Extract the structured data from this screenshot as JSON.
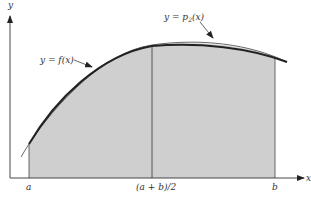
{
  "diagram": {
    "type": "simpsons-rule-illustration",
    "axes": {
      "x_label": "x",
      "y_label": "y"
    },
    "tick_labels": {
      "a": "a",
      "midpoint": "(a + b)/2",
      "b": "b"
    },
    "curves": {
      "f": {
        "label_prefix": "y = ",
        "label_func": "f(x)",
        "color": "#222222"
      },
      "p2": {
        "label_prefix": "y = ",
        "label_func_p": "p",
        "label_func_sub": "2",
        "label_func_arg": "(x)",
        "color": "#555555"
      }
    },
    "colors": {
      "shade": "#cfcfcf",
      "axis": "#333333",
      "background": "#ffffff"
    }
  }
}
